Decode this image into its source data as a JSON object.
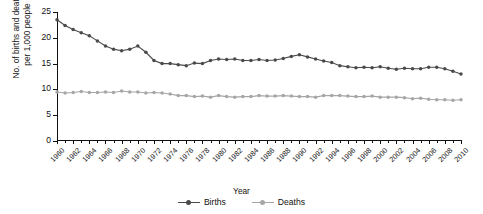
{
  "chart_data": {
    "type": "line",
    "title": "",
    "xlabel": "Year",
    "ylabel_line1": "No. of births and deaths",
    "ylabel_line2": "per 1,000 people",
    "grid": false,
    "legend_position": "bottom",
    "xlim": [
      1960,
      2010
    ],
    "ylim": [
      0,
      25
    ],
    "yticks": [
      0,
      5,
      10,
      15,
      20,
      25
    ],
    "xtick_labels": [
      "1960",
      "1962",
      "1964",
      "1966",
      "1968",
      "1970",
      "1972",
      "1974",
      "1976",
      "1978",
      "1980",
      "1982",
      "1984",
      "1986",
      "1988",
      "1990",
      "1992",
      "1994",
      "1996",
      "1998",
      "2000",
      "2002",
      "2004",
      "2006",
      "2008",
      "2010"
    ],
    "x": [
      1960,
      1961,
      1962,
      1963,
      1964,
      1965,
      1966,
      1967,
      1968,
      1969,
      1970,
      1971,
      1972,
      1973,
      1974,
      1975,
      1976,
      1977,
      1978,
      1979,
      1980,
      1981,
      1982,
      1983,
      1984,
      1985,
      1986,
      1987,
      1988,
      1989,
      1990,
      1991,
      1992,
      1993,
      1994,
      1995,
      1996,
      1997,
      1998,
      1999,
      2000,
      2001,
      2002,
      2003,
      2004,
      2005,
      2006,
      2007,
      2008,
      2009,
      2010
    ],
    "series": [
      {
        "name": "Births",
        "color": "#4a4a4a",
        "values": [
          23.5,
          22.4,
          21.6,
          21.0,
          20.4,
          19.4,
          18.4,
          17.8,
          17.5,
          17.8,
          18.4,
          17.2,
          15.6,
          15.0,
          15.0,
          14.8,
          14.6,
          15.1,
          15.0,
          15.6,
          15.9,
          15.8,
          15.9,
          15.6,
          15.6,
          15.8,
          15.6,
          15.7,
          16.0,
          16.4,
          16.7,
          16.3,
          15.9,
          15.5,
          15.2,
          14.6,
          14.4,
          14.2,
          14.3,
          14.2,
          14.4,
          14.1,
          13.9,
          14.1,
          14.0,
          14.0,
          14.3,
          14.3,
          14.0,
          13.5,
          13.0
        ]
      },
      {
        "name": "Deaths",
        "color": "#a6a6a6",
        "values": [
          9.5,
          9.3,
          9.4,
          9.6,
          9.4,
          9.4,
          9.5,
          9.4,
          9.7,
          9.5,
          9.5,
          9.3,
          9.4,
          9.3,
          9.1,
          8.8,
          8.8,
          8.6,
          8.7,
          8.5,
          8.8,
          8.6,
          8.5,
          8.6,
          8.6,
          8.8,
          8.7,
          8.7,
          8.8,
          8.7,
          8.6,
          8.6,
          8.5,
          8.8,
          8.8,
          8.8,
          8.7,
          8.6,
          8.6,
          8.7,
          8.5,
          8.5,
          8.5,
          8.4,
          8.2,
          8.3,
          8.1,
          8.0,
          8.0,
          7.9,
          8.0
        ]
      }
    ]
  },
  "legend": {
    "items": [
      {
        "label": "Births"
      },
      {
        "label": "Deaths"
      }
    ]
  }
}
